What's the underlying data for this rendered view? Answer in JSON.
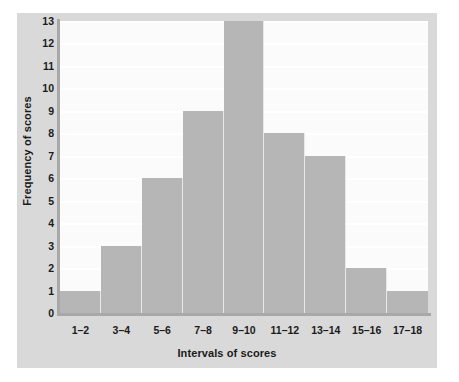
{
  "chart_data": {
    "type": "bar",
    "title": "",
    "subtitle": "",
    "xlabel": "Intervals of scores",
    "ylabel": "Frequency of scores",
    "categories": [
      "1–2",
      "3–4",
      "5–6",
      "7–8",
      "9–10",
      "11–12",
      "13–14",
      "15–16",
      "17–18"
    ],
    "values": [
      1,
      3,
      6,
      9,
      13,
      8,
      7,
      2,
      1
    ],
    "ylim": [
      0,
      13
    ],
    "yticks": [
      0,
      1,
      2,
      3,
      4,
      5,
      6,
      7,
      8,
      9,
      10,
      11,
      12,
      13
    ],
    "ytick_labels": [
      "0",
      "1",
      "2",
      "3",
      "4",
      "5",
      "6",
      "7",
      "8",
      "9",
      "10",
      "11",
      "12",
      "13"
    ],
    "grid": true,
    "grid_axis": "y",
    "legend": false,
    "legend_position": "none",
    "bar_gap": 0,
    "series": [
      {
        "name": "Frequency of scores",
        "values": [
          1,
          3,
          6,
          9,
          13,
          8,
          7,
          2,
          1
        ]
      }
    ],
    "annotations": []
  },
  "colors": {
    "bar_fill": "#b6b6b6",
    "bar_edge": "#e8e8e8",
    "panel_background": "#d9d9d9",
    "plot_background": "#fbfbfb",
    "gridline": "#ffffff",
    "axis_line": "#a8a8a8",
    "text": "#1b1b1b",
    "page_background": "#ffffff"
  }
}
